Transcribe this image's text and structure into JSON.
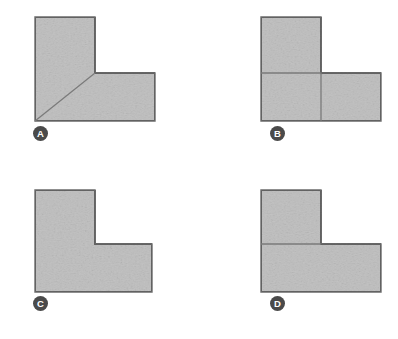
{
  "figure": {
    "type": "multiple-choice-geometry-diagram",
    "background_color": "#ffffff",
    "shape_fill_color": "#dedede",
    "shape_stroke_color": "#6b6b6b",
    "divider_line_color": "#7a7a7a",
    "badge_fill_color": "#4a4a4a",
    "badge_text_color": "#ffffff",
    "panels": [
      {
        "id": "A",
        "label": "A",
        "shape": "L-shape",
        "internal_lines": [
          "diagonal from bottom-left vertex to inner reflex corner"
        ],
        "partition_count": 2
      },
      {
        "id": "B",
        "label": "B",
        "shape": "L-shape",
        "internal_lines": [
          "horizontal line across the left column at the notch level",
          "vertical line down from the inner reflex corner to the bottom edge"
        ],
        "partition_count": 3
      },
      {
        "id": "C",
        "label": "C",
        "shape": "L-shape",
        "internal_lines": [],
        "partition_count": 1
      },
      {
        "id": "D",
        "label": "D",
        "shape": "L-shape",
        "internal_lines": [
          "horizontal line across the left column at the notch level"
        ],
        "partition_count": 2
      }
    ]
  }
}
